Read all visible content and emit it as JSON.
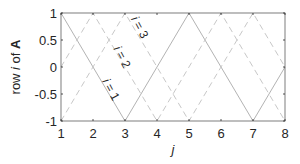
{
  "chart_data": {
    "type": "line",
    "title": "",
    "xlabel": "j",
    "ylabel_parts": [
      "row ",
      "i",
      " of ",
      "A"
    ],
    "ylabel": "row i of A",
    "xlim": [
      1,
      8
    ],
    "ylim": [
      -1,
      1
    ],
    "grid": false,
    "x_ticks": [
      1,
      2,
      3,
      4,
      5,
      6,
      7,
      8
    ],
    "x_tick_labels": [
      "1",
      "2",
      "3",
      "4",
      "5",
      "6",
      "7",
      "8"
    ],
    "y_ticks": [
      1,
      0.5,
      0,
      -0.5,
      -1
    ],
    "y_tick_labels": [
      "1",
      "0.5",
      "0",
      "-0.5",
      "-1"
    ],
    "series": [
      {
        "name": "i = 1",
        "style": "solid",
        "color": "#b3b3b3",
        "x": [
          1,
          3,
          5,
          7,
          8
        ],
        "y": [
          1,
          -1,
          1,
          -1,
          0
        ]
      },
      {
        "name": "i = 2",
        "style": "dashed",
        "color": "#c8c8c8",
        "x": [
          1,
          2,
          4,
          6,
          8
        ],
        "y": [
          0,
          1,
          -1,
          1,
          -1
        ]
      },
      {
        "name": "i = 3",
        "style": "dashed",
        "color": "#c8c8c8",
        "x": [
          1,
          3,
          5,
          7,
          8
        ],
        "y": [
          -1,
          1,
          -1,
          1,
          0
        ]
      }
    ],
    "annotations": [
      {
        "text": "i = 1",
        "x": 2.45,
        "y": -0.45,
        "rotation": 62
      },
      {
        "text": "i = 2",
        "x": 2.8,
        "y": 0.15,
        "rotation": 62
      },
      {
        "text": "i = 3",
        "x": 3.35,
        "y": 0.7,
        "rotation": 62
      }
    ]
  }
}
